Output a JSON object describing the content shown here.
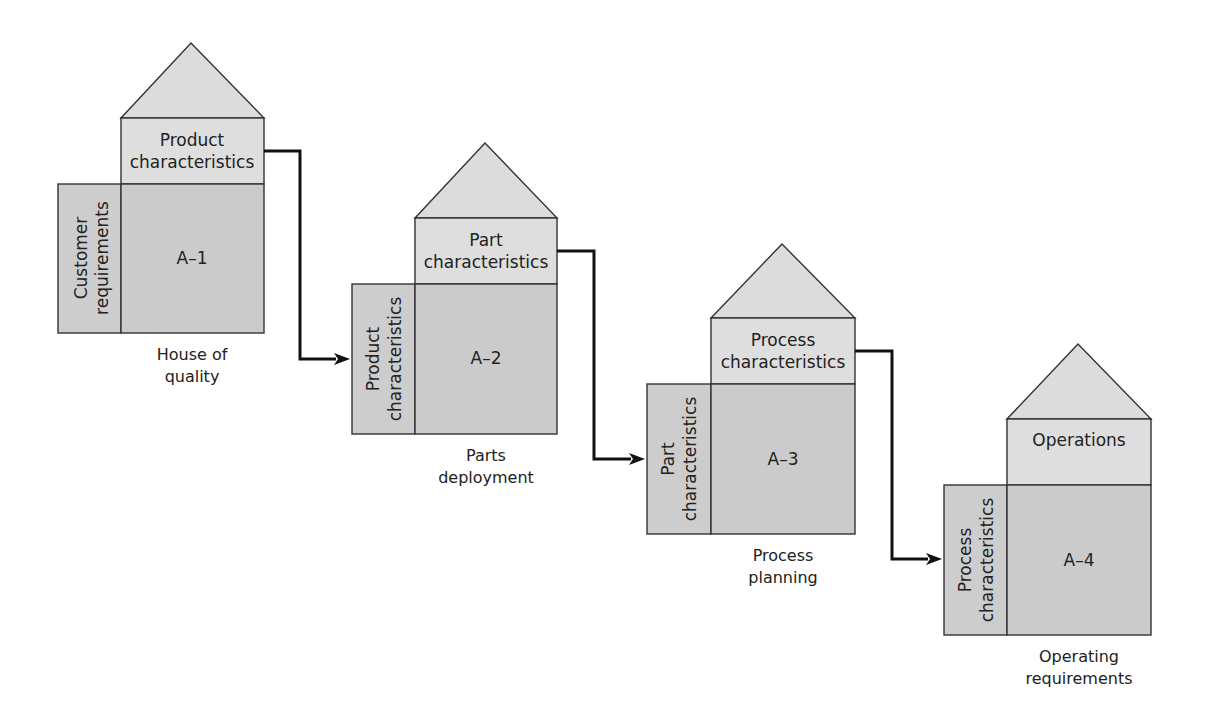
{
  "diagram": {
    "type": "QFD four-phase house-of-quality cascade",
    "houses": [
      {
        "id": "A-1",
        "matrix_label": "A–1",
        "top_label": [
          "Product",
          "characteristics"
        ],
        "side_label": [
          "Customer",
          "requirements"
        ],
        "caption": [
          "House of",
          "quality"
        ]
      },
      {
        "id": "A-2",
        "matrix_label": "A–2",
        "top_label": [
          "Part",
          "characteristics"
        ],
        "side_label": [
          "Product",
          "characteristics"
        ],
        "caption": [
          "Parts",
          "deployment"
        ]
      },
      {
        "id": "A-3",
        "matrix_label": "A–3",
        "top_label": [
          "Process",
          "characteristics"
        ],
        "side_label": [
          "Part",
          "characteristics"
        ],
        "caption": [
          "Process",
          "planning"
        ]
      },
      {
        "id": "A-4",
        "matrix_label": "A–4",
        "top_label": [
          "Operations"
        ],
        "side_label": [
          "Process",
          "characteristics"
        ],
        "caption": [
          "Operating",
          "requirements"
        ]
      }
    ],
    "connectors": [
      {
        "from": "A-1",
        "to": "A-2"
      },
      {
        "from": "A-2",
        "to": "A-3"
      },
      {
        "from": "A-3",
        "to": "A-4"
      }
    ],
    "colors": {
      "roof": "#dcdcdc",
      "top_box": "#dedede",
      "matrix": "#cbcbcb",
      "stroke": "#333333",
      "arrow": "#111111"
    }
  }
}
